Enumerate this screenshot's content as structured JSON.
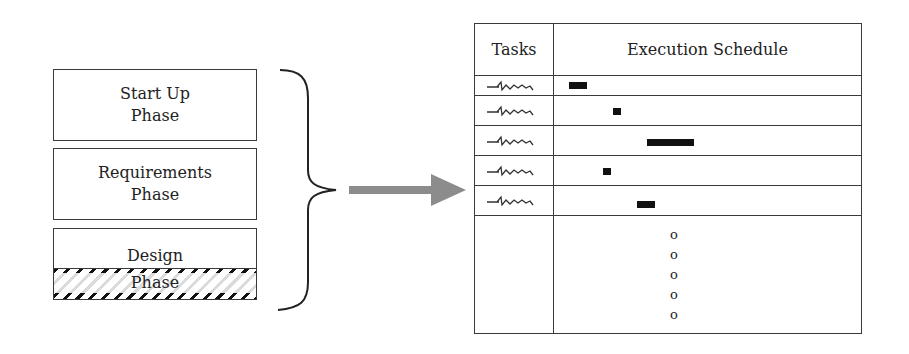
{
  "phases": [
    {
      "line1": "Start Up",
      "line2": "Phase"
    },
    {
      "line1": "Requirements",
      "line2": "Phase"
    },
    {
      "line1": "Design",
      "line2": "Phase",
      "hatched_portion": "lower half"
    }
  ],
  "connector": {
    "brace": "right-curly-brace",
    "arrow": "gray-right-arrow",
    "arrow_color": "#8c8c8c"
  },
  "table": {
    "headers": {
      "tasks": "Tasks",
      "schedule": "Execution Schedule"
    },
    "rows": [
      {
        "task": "handwritten-squiggle",
        "bar_start": 15,
        "bar_width": 18
      },
      {
        "task": "handwritten-squiggle",
        "bar_start": 59,
        "bar_width": 8
      },
      {
        "task": "handwritten-squiggle",
        "bar_start": 93,
        "bar_width": 47
      },
      {
        "task": "handwritten-squiggle",
        "bar_start": 49,
        "bar_width": 8
      },
      {
        "task": "handwritten-squiggle",
        "bar_start": 83,
        "bar_width": 18
      }
    ],
    "continuation": [
      "o",
      "o",
      "o",
      "o",
      "o"
    ]
  }
}
